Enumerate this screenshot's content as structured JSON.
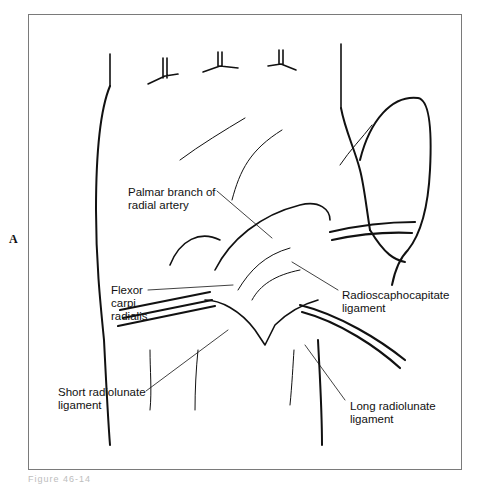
{
  "figure": {
    "panel_letter": "A",
    "caption": "Figure 46-14"
  },
  "labels": [
    {
      "id": "palmar-branch",
      "text": "Palmar branch of\nradial artery"
    },
    {
      "id": "flexor-carpi-radialis",
      "text": "Flexor\ncarpi\nradialis"
    },
    {
      "id": "radioscaphocapitate",
      "text": "Radioscaphocapitate\nligament"
    },
    {
      "id": "short-radiolunate",
      "text": "Short radiolunate\nligament"
    },
    {
      "id": "long-radiolunate",
      "text": "Long radiolunate\nligament"
    }
  ],
  "colors": {
    "line": "#111111",
    "frame": "#7a7a7a",
    "caption": "#bdbdbd"
  }
}
